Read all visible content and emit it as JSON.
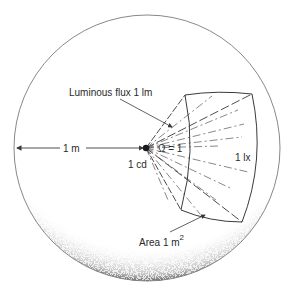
{
  "diagram": {
    "type": "photometry-sphere",
    "labels": {
      "luminous_flux": "Luminous flux 1 lm",
      "distance": "1 m",
      "intensity": "1 cd",
      "solid_angle": "Ω = 1",
      "illuminance": "1 lx",
      "area": "Area 1 m",
      "area_exponent": "2"
    },
    "colors": {
      "line": "#3a3a3a",
      "sphere_outline": "#7a7a7a",
      "shading": "#222222",
      "background": "#ffffff"
    }
  }
}
